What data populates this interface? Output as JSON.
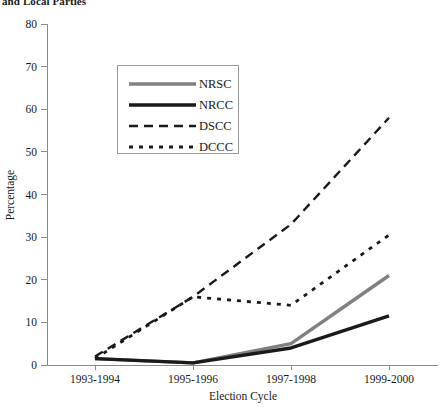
{
  "chart_data": {
    "type": "line",
    "title": "and Local Parties",
    "xlabel": "Election Cycle",
    "ylabel": "Percentage",
    "categories": [
      "1993-1994",
      "1995-1996",
      "1997-1998",
      "1999-2000"
    ],
    "ylim": [
      0,
      80
    ],
    "yticks": [
      0,
      10,
      20,
      30,
      40,
      50,
      60,
      70,
      80
    ],
    "ytick_labels": [
      "0",
      "10",
      "20",
      "30",
      "40",
      "50",
      "60",
      "70",
      "80"
    ],
    "grid": false,
    "legend_position": "upper-center-left",
    "series": [
      {
        "name": "NRSC",
        "values": [
          1.5,
          0.5,
          5,
          21
        ],
        "color": "#808080",
        "style": "solid",
        "width": 3.4
      },
      {
        "name": "NRCC",
        "values": [
          1.5,
          0.5,
          4,
          11.5
        ],
        "color": "#1a1a1a",
        "style": "solid",
        "width": 3.4
      },
      {
        "name": "DSCC",
        "values": [
          2,
          16,
          33,
          58
        ],
        "color": "#1a1a1a",
        "style": "dashed",
        "width": 2.4,
        "dash": "9,6"
      },
      {
        "name": "DCCC",
        "values": [
          1.5,
          16,
          14,
          30.5
        ],
        "color": "#1a1a1a",
        "style": "dotted",
        "width": 2.8,
        "dash": "4,6"
      }
    ]
  },
  "axes": {
    "y_title": "Percentage",
    "x_title": "Election Cycle"
  },
  "legend": {
    "entries": [
      "NRSC",
      "NRCC",
      "DSCC",
      "DCCC"
    ]
  }
}
